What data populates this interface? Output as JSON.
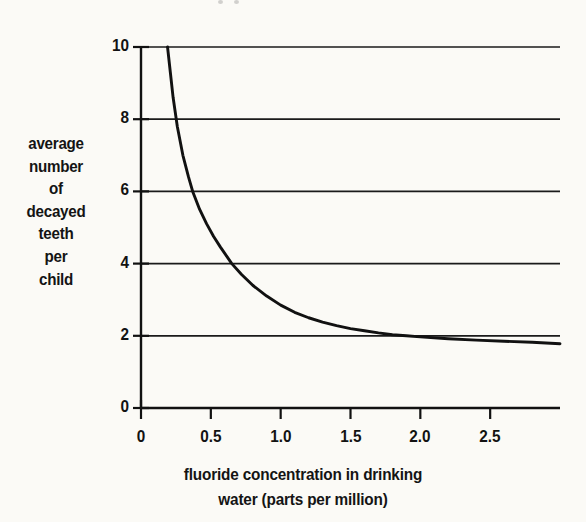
{
  "chart_data": {
    "type": "line",
    "title": "",
    "xlabel": "fluoride concentration in drinking water (parts per million)",
    "ylabel": "average number of decayed teeth per child",
    "xlabel_lines": [
      "fluoride concentration in drinking",
      "water (parts per million)"
    ],
    "ylabel_lines": [
      "average",
      "number",
      "of",
      "decayed",
      "teeth",
      "per",
      "child"
    ],
    "xlim": [
      0,
      3.0
    ],
    "ylim": [
      0,
      10
    ],
    "xticks": [
      0,
      0.5,
      1.0,
      1.5,
      2.0,
      2.5
    ],
    "xtick_labels": [
      "0",
      "0.5",
      "1.0",
      "1.5",
      "2.0",
      "2.5"
    ],
    "yticks": [
      0,
      2,
      4,
      6,
      8,
      10
    ],
    "ytick_labels": [
      "0",
      "2",
      "4",
      "6",
      "8",
      "10"
    ],
    "grid": "horizontal",
    "legend": "none",
    "series": [
      {
        "name": "average number of decayed teeth per child",
        "color": "#111111",
        "x": [
          0.19,
          0.21,
          0.23,
          0.26,
          0.3,
          0.34,
          0.37,
          0.42,
          0.47,
          0.52,
          0.57,
          0.65,
          0.72,
          0.8,
          0.9,
          1.0,
          1.1,
          1.2,
          1.3,
          1.4,
          1.5,
          1.6,
          1.7,
          1.8,
          1.9,
          2.0,
          2.2,
          2.4,
          2.6,
          2.8,
          3.0
        ],
        "y": [
          10.0,
          9.3,
          8.6,
          7.8,
          7.0,
          6.4,
          6.0,
          5.5,
          5.1,
          4.75,
          4.45,
          4.0,
          3.7,
          3.4,
          3.1,
          2.85,
          2.65,
          2.5,
          2.38,
          2.28,
          2.2,
          2.14,
          2.08,
          2.03,
          2.0,
          1.97,
          1.92,
          1.88,
          1.85,
          1.82,
          1.78
        ]
      }
    ],
    "asymptote_value": 1.78,
    "notable_points": [
      {
        "x": 0.19,
        "y": 10.0
      },
      {
        "x": 0.23,
        "y": 8.0
      },
      {
        "x": 0.37,
        "y": 6.0
      },
      {
        "x": 0.65,
        "y": 4.0
      },
      {
        "x": 1.5,
        "y": 2.2
      },
      {
        "x": 1.9,
        "y": 2.0
      },
      {
        "x": 3.0,
        "y": 1.78
      }
    ]
  },
  "style": {
    "background": "#fbfaf6",
    "ink": "#111111",
    "gridline": "#1a1a1a"
  }
}
